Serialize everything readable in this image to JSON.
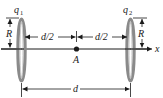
{
  "diagram": {
    "colors": {
      "line": "#1a1a1a",
      "ring_outer": "#8a8a8a",
      "ring_inner": "#d0d0d0",
      "background": "#ffffff"
    },
    "rings": [
      {
        "id": "ring-1",
        "label": "q",
        "subscript": "1",
        "radius_label": "R"
      },
      {
        "id": "ring-2",
        "label": "q",
        "subscript": "2",
        "radius_label": "R"
      }
    ],
    "axis": {
      "label": "x"
    },
    "point": {
      "label": "A"
    },
    "dimensions": {
      "left_half": "d/2",
      "right_half": "d/2",
      "total": "d"
    }
  }
}
